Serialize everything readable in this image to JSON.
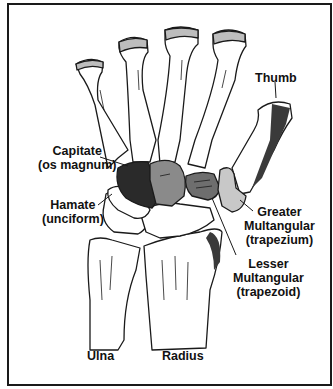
{
  "diagram": {
    "colors": {
      "line": "#1a1a1a",
      "bone_fill": "#ffffff",
      "capitate_fill": "#2a2a2a",
      "lunate_fill": "#8a8a8a",
      "trapezoid_fill": "#6e6e6e",
      "trapezium_fill": "#c8c8c8"
    },
    "labels": {
      "thumb": {
        "lines": [
          "Thumb"
        ]
      },
      "capitate": {
        "lines": [
          "Capitate",
          "(os magnum)"
        ]
      },
      "hamate": {
        "lines": [
          "Hamate",
          "(unciform)"
        ]
      },
      "greater_multangular": {
        "lines": [
          "Greater",
          "Multangular",
          "(trapezium)"
        ]
      },
      "lesser_multangular": {
        "lines": [
          "Lesser",
          "Multangular",
          "(trapezoid)"
        ]
      },
      "ulna": {
        "lines": [
          "Ulna"
        ]
      },
      "radius": {
        "lines": [
          "Radius"
        ]
      }
    }
  }
}
